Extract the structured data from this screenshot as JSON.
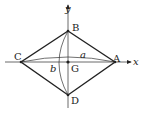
{
  "diagram": {
    "axes": {
      "x_label": "x",
      "y_label": "y"
    },
    "points": {
      "A": "A",
      "B": "B",
      "C": "C",
      "D": "D",
      "G": "G"
    },
    "arcs": {
      "a": "a",
      "b": "b"
    },
    "colors": {
      "stroke": "#222222",
      "background": "#ffffff"
    }
  }
}
